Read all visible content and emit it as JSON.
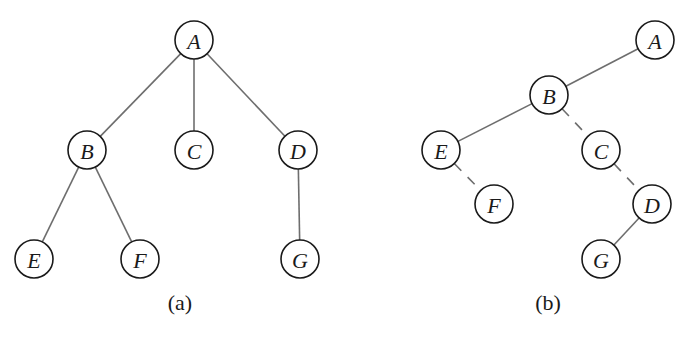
{
  "node_radius": 19,
  "colors": {
    "edge": "#6e6e6e",
    "node_stroke": "#1a1a1a",
    "text": "#1a1a1a",
    "background": "#ffffff"
  },
  "trees": [
    {
      "id": "a",
      "caption": "(a)",
      "caption_pos": [
        180,
        302
      ],
      "nodes": [
        {
          "id": "A",
          "label": "A",
          "x": 194,
          "y": 40
        },
        {
          "id": "B",
          "label": "B",
          "x": 87,
          "y": 150
        },
        {
          "id": "C",
          "label": "C",
          "x": 194,
          "y": 150
        },
        {
          "id": "D",
          "label": "D",
          "x": 298,
          "y": 150
        },
        {
          "id": "E",
          "label": "E",
          "x": 34,
          "y": 259
        },
        {
          "id": "F",
          "label": "F",
          "x": 140,
          "y": 259
        },
        {
          "id": "G",
          "label": "G",
          "x": 300,
          "y": 259
        }
      ],
      "edges": [
        {
          "from": "A",
          "to": "B",
          "style": "solid"
        },
        {
          "from": "A",
          "to": "C",
          "style": "solid"
        },
        {
          "from": "A",
          "to": "D",
          "style": "solid"
        },
        {
          "from": "B",
          "to": "E",
          "style": "solid"
        },
        {
          "from": "B",
          "to": "F",
          "style": "solid"
        },
        {
          "from": "D",
          "to": "G",
          "style": "solid"
        }
      ]
    },
    {
      "id": "b",
      "caption": "(b)",
      "caption_pos": [
        548,
        302
      ],
      "nodes": [
        {
          "id": "A",
          "label": "A",
          "x": 655,
          "y": 40
        },
        {
          "id": "B",
          "label": "B",
          "x": 549,
          "y": 95
        },
        {
          "id": "C",
          "label": "C",
          "x": 601,
          "y": 150
        },
        {
          "id": "D",
          "label": "D",
          "x": 652,
          "y": 204
        },
        {
          "id": "E",
          "label": "E",
          "x": 441,
          "y": 150
        },
        {
          "id": "F",
          "label": "F",
          "x": 494,
          "y": 204
        },
        {
          "id": "G",
          "label": "G",
          "x": 601,
          "y": 259
        }
      ],
      "edges": [
        {
          "from": "A",
          "to": "B",
          "style": "solid"
        },
        {
          "from": "B",
          "to": "E",
          "style": "solid"
        },
        {
          "from": "B",
          "to": "C",
          "style": "dashed"
        },
        {
          "from": "E",
          "to": "F",
          "style": "dashed"
        },
        {
          "from": "C",
          "to": "D",
          "style": "dashed"
        },
        {
          "from": "D",
          "to": "G",
          "style": "solid"
        }
      ]
    }
  ]
}
